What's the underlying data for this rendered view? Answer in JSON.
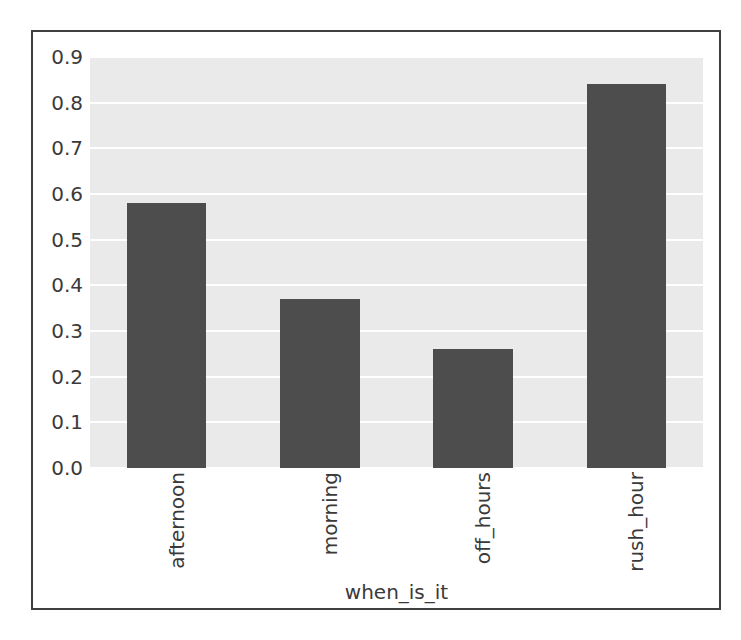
{
  "chart_data": {
    "type": "bar",
    "title": "",
    "xlabel": "when_is_it",
    "ylabel": "",
    "categories": [
      "afternoon",
      "morning",
      "off_hours",
      "rush_hour"
    ],
    "values": [
      0.58,
      0.37,
      0.26,
      0.84
    ],
    "ylim": [
      0.0,
      0.9
    ],
    "xlim": [
      -0.5,
      3.5
    ],
    "ytick_labels": [
      "0.0",
      "0.1",
      "0.2",
      "0.3",
      "0.4",
      "0.5",
      "0.6",
      "0.7",
      "0.8",
      "0.9"
    ],
    "ytick_values": [
      0.0,
      0.1,
      0.2,
      0.3,
      0.4,
      0.5,
      0.6,
      0.7,
      0.8,
      0.9
    ],
    "xtick_labels": [
      "afternoon",
      "morning",
      "off_hours",
      "rush_hour"
    ],
    "xtick_rotation": 90,
    "grid": true,
    "grid_axis": "y",
    "legend": false,
    "legend_position": "none",
    "bar_color": "#4d4d4d",
    "plot_background": "#eaeaea",
    "gridline_color": "#ffffff",
    "text_color": "#3a3a3a",
    "frame_color": "#3f3f3f",
    "bar_width_fraction": 0.52
  }
}
